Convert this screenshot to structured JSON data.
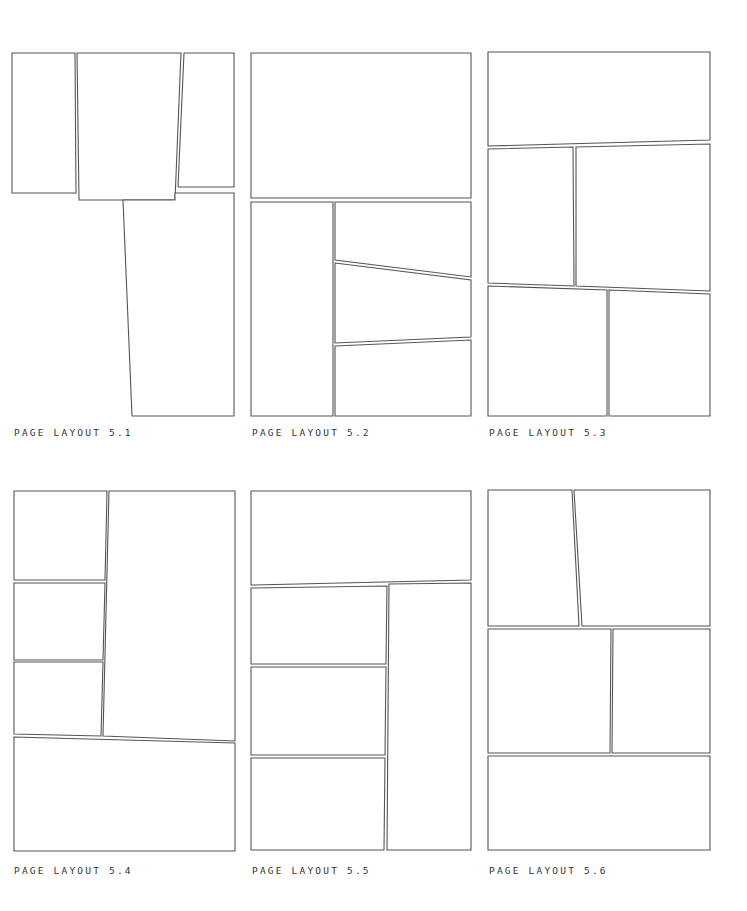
{
  "layouts": [
    {
      "label": "PAGE LAYOUT 5.1",
      "label_pos": [
        14,
        428
      ],
      "panels": [
        "12,53 75,53 76,193 12,193",
        "77,53 181,53 175,200 79,200",
        "184,53 234,53 234,187 178,187",
        "123,200 175,200 175,193 234,193 234,416 132,416"
      ]
    },
    {
      "label": "PAGE LAYOUT 5.2",
      "label_pos": [
        252,
        428
      ],
      "panels": [
        "251,53 471,53 471,198 251,198",
        "251,202 333,202 333,416 251,416",
        "335,202 471,202 471,277 335,260",
        "335,263 471,280 471,337 335,343",
        "335,346 471,340 471,416 335,416"
      ]
    },
    {
      "label": "PAGE LAYOUT 5.3",
      "label_pos": [
        489,
        428
      ],
      "panels": [
        "488,52 710,52 710,140 488,146",
        "488,149 573,147 574,286 488,283",
        "576,147 710,144 710,291 576,286",
        "488,286 607,290 607,416 488,416",
        "609,290 710,294 710,416 609,416"
      ]
    },
    {
      "label": "PAGE LAYOUT 5.4",
      "label_pos": [
        14,
        866
      ],
      "panels": [
        "14,491 107,491 105,580 14,580",
        "14,583 105,583 103,660 14,660",
        "14,662 103,662 101,736 14,734",
        "109,491 235,491 235,741 103,736",
        "14,737 235,743 235,851 14,851"
      ]
    },
    {
      "label": "PAGE LAYOUT 5.5",
      "label_pos": [
        252,
        866
      ],
      "panels": [
        "251,491 471,491 471,580 251,585",
        "251,588 387,586 386,664 251,664",
        "251,667 386,667 385,755 251,755",
        "251,758 385,758 384,850 251,850",
        "389,584 471,583 471,850 387,850"
      ]
    },
    {
      "label": "PAGE LAYOUT 5.6",
      "label_pos": [
        489,
        866
      ],
      "panels": [
        "488,490 572,490 579,626 488,626",
        "574,490 710,490 710,626 582,626",
        "488,629 611,629 610,753 488,753",
        "613,629 710,629 710,753 612,753",
        "488,756 710,756 710,850 488,850"
      ]
    }
  ],
  "colors": {
    "stroke": "#555555",
    "label": "#333333",
    "background": "#ffffff"
  }
}
